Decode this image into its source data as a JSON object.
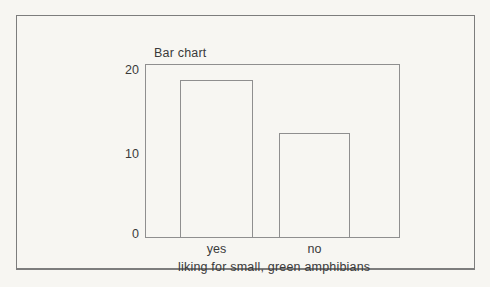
{
  "figure": {
    "background_color": "#f7f6f2",
    "frame_border_color": "#7d7d7d",
    "line_color": "#8f8f8f",
    "text_color": "#3a3a3a"
  },
  "chart_data": {
    "type": "bar",
    "title": "Bar chart",
    "categories": [
      "yes",
      "no"
    ],
    "values": [
      18,
      12
    ],
    "xlabel": "liking for small, green amphibians",
    "ylabel": "",
    "ylim": [
      0,
      20
    ],
    "yticks": [
      "20",
      "10",
      "0"
    ],
    "grid": false,
    "legend": false,
    "bar_fill": "none",
    "plot_height_px": 174
  }
}
